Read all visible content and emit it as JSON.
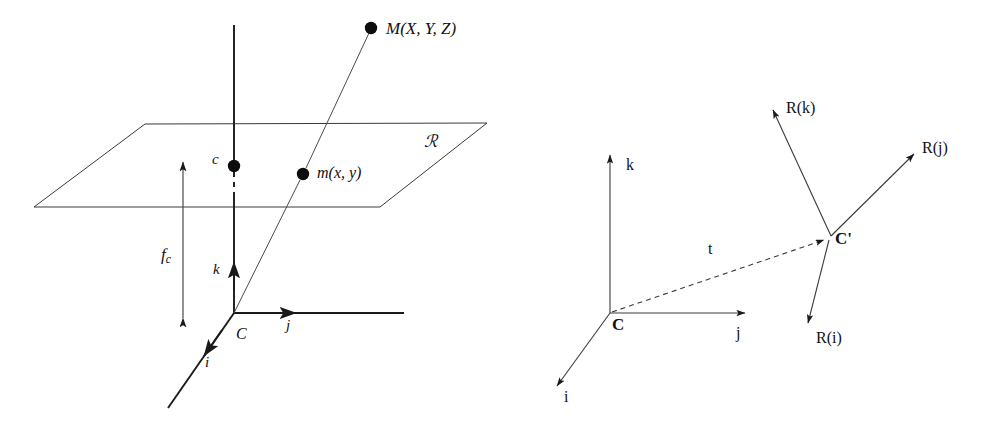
{
  "figure": {
    "background_color": "#ffffff",
    "stroke_color": "#1a1a1a",
    "width": 986,
    "height": 427
  },
  "left_diagram": {
    "name": "pinhole-projection",
    "labels": {
      "world_point": "M(X, Y, Z)",
      "image_point": "m(x, y)",
      "principal_point": "c",
      "image_plane": "ℛ",
      "focal_length": "f",
      "focal_length_subscript": "c",
      "axis_i": "i",
      "axis_j": "j",
      "axis_k": "k",
      "origin": "C"
    },
    "geometry": {
      "optical_center": [
        234,
        313
      ],
      "principal_point_dot": [
        234,
        166
      ],
      "image_point_dot": [
        303,
        174
      ],
      "world_point_dot": [
        371,
        28
      ],
      "plane_corners": [
        [
          145,
          124
        ],
        [
          487,
          123
        ],
        [
          380,
          207
        ],
        [
          34,
          207
        ]
      ],
      "axis_j_end": [
        404,
        313
      ],
      "axis_i_end": [
        168,
        408
      ],
      "axis_k_top": [
        234,
        25
      ],
      "focal_arrow_x": 183,
      "focal_arrow_top_y": 162,
      "focal_arrow_bottom_y": 318
    }
  },
  "right_diagram": {
    "name": "rigid-transform",
    "labels": {
      "origin": "C",
      "origin_transformed": "C'",
      "translation": "t",
      "axis_i": "i",
      "axis_j": "j",
      "axis_k": "k",
      "rotated_i": "R(i)",
      "rotated_j": "R(j)",
      "rotated_k": "R(k)"
    },
    "geometry": {
      "origin": [
        610,
        313
      ],
      "origin_transformed": [
        828,
        238
      ],
      "axis_k_end": [
        610,
        155
      ],
      "axis_j_end": [
        745,
        313
      ],
      "axis_i_end": [
        555,
        388
      ],
      "rotated_k_end": [
        772,
        108
      ],
      "rotated_j_end": [
        916,
        152
      ],
      "rotated_i_end": [
        810,
        325
      ],
      "translation_dashed": true
    }
  }
}
